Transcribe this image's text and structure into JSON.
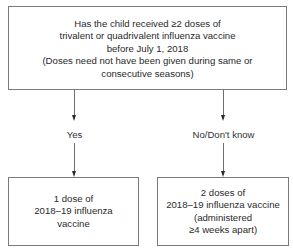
{
  "diagram": {
    "type": "flowchart",
    "question_box": {
      "lines": [
        "Has the child received ≥2 doses of",
        "trivalent or quadrivalent influenza vaccine",
        "before July 1, 2018",
        "(Doses need not have been given during same or",
        "consecutive seasons)"
      ]
    },
    "branches": [
      {
        "label": "Yes",
        "result_lines": [
          "1 dose of",
          "2018–19 influenza",
          "vaccine"
        ]
      },
      {
        "label": "No/Don't know",
        "result_lines": [
          "2 doses of",
          "2018–19 influenza vaccine",
          "(administered",
          "≥4 weeks apart)"
        ]
      }
    ],
    "colors": {
      "border": "#7a7a7a",
      "line": "#6e6e6e",
      "text": "#2a2a2a",
      "background": "#ffffff"
    }
  }
}
